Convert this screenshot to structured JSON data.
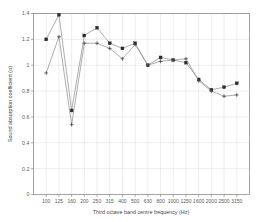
{
  "chart_data": {
    "type": "line",
    "title": "",
    "subtitle": "",
    "xlabel": "Third octave band centre frequency (Hz)",
    "ylabel": "Sound absorption coefficient (α)",
    "categories": [
      "100",
      "125",
      "160",
      "200",
      "250",
      "315",
      "400",
      "500",
      "630",
      "800",
      "1000",
      "1250",
      "1600",
      "2000",
      "2500",
      "3150"
    ],
    "xtick_labels": [
      "100",
      "125",
      "160",
      "200",
      "250",
      "315",
      "400",
      "500",
      "630",
      "800",
      "1000",
      "1250",
      "1600",
      "2000",
      "2500",
      "3150"
    ],
    "ytick_labels": [
      "0",
      "0.2",
      "0.4",
      "0.6",
      "0.8",
      "1",
      "1.2",
      "1.4"
    ],
    "ytick_values": [
      0,
      0.2,
      0.4,
      0.6,
      0.8,
      1.0,
      1.2,
      1.4
    ],
    "ylim": [
      0,
      1.4
    ],
    "xlim": [
      0,
      17
    ],
    "grid": true,
    "legend_position": "none",
    "series": [
      {
        "name": "Series 1",
        "marker": "square",
        "values": [
          1.2,
          1.39,
          0.65,
          1.23,
          1.29,
          1.17,
          1.13,
          1.17,
          1.0,
          1.06,
          1.04,
          1.02,
          0.89,
          0.81,
          0.83,
          0.86
        ]
      },
      {
        "name": "Series 2",
        "marker": "plus",
        "values": [
          0.94,
          1.22,
          0.54,
          1.17,
          1.17,
          1.13,
          1.05,
          1.16,
          1.0,
          1.03,
          1.04,
          1.05,
          0.88,
          0.8,
          0.76,
          0.77
        ]
      }
    ]
  },
  "axes": {
    "y_axis_title": "Sound absorption coefficient (α)",
    "x_axis_title": "Third octave band centre frequency (Hz)"
  },
  "colors": {
    "marker": "#2b2b2b",
    "line": "#8a8a8a",
    "grid": "#d7d7d7",
    "frame": "#7d7d7d",
    "text": "#5a5a5a",
    "background": "#ffffff"
  }
}
